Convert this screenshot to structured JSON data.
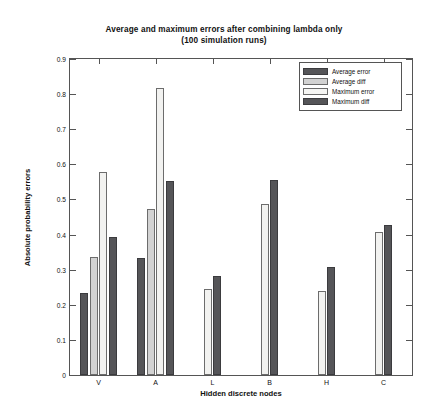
{
  "chart_data": {
    "type": "bar",
    "title": "Average and maximum errors after combining lambda only",
    "subtitle": "(100 simulation runs)",
    "xlabel": "Hidden discrete nodes",
    "ylabel": "Absolute probability errors",
    "ylim": [
      0,
      0.9
    ],
    "ytick_labels": [
      "0",
      "0.1",
      "0.2",
      "0.3",
      "0.4",
      "0.5",
      "0.6",
      "0.7",
      "0.8",
      "0.9"
    ],
    "ytick_values": [
      0,
      0.1,
      0.2,
      0.3,
      0.4,
      0.5,
      0.6,
      0.7,
      0.8,
      0.9
    ],
    "categories": [
      "V",
      "A",
      "L",
      "B",
      "H",
      "C"
    ],
    "grid": false,
    "legend_position": "top-right",
    "series": [
      {
        "name": "Average error",
        "color": "#555558",
        "values": [
          0.235,
          0.333,
          null,
          null,
          null,
          null
        ]
      },
      {
        "name": "Average diff",
        "color": "#d2d2d2",
        "values": [
          0.335,
          0.472,
          null,
          null,
          null,
          null
        ]
      },
      {
        "name": "Maximum error",
        "color": "#f2f2f0",
        "values": [
          0.578,
          0.818,
          0.245,
          0.488,
          0.239,
          0.406
        ]
      },
      {
        "name": "Maximum diff",
        "color": "#555558",
        "values": [
          0.392,
          0.552,
          0.281,
          0.555,
          0.309,
          0.428
        ]
      }
    ]
  },
  "legend": {
    "entries": [
      {
        "label": "Average error",
        "swatch": "avg-error"
      },
      {
        "label": "Average diff",
        "swatch": "avg-diff"
      },
      {
        "label": "Maximum error",
        "swatch": "max-error"
      },
      {
        "label": "Maximum diff",
        "swatch": "max-diff"
      }
    ]
  }
}
